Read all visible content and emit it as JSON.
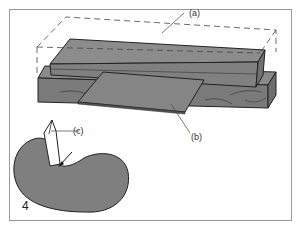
{
  "figure": {
    "panel_number": "4",
    "labels": {
      "a": "(a)",
      "b": "(b)",
      "c": "(c)"
    },
    "colors": {
      "fill": "#7f7f7f",
      "fill_dark": "#6e6e6e",
      "stroke": "#222222",
      "frame": "#9a9a9a",
      "tool": "#ffffff"
    }
  }
}
